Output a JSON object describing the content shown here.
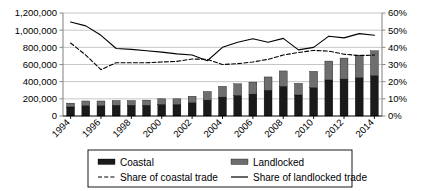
{
  "chart_data": {
    "type": "bar",
    "title": "",
    "subtitle": "",
    "xlabel": "",
    "ylabel": "",
    "y2label": "",
    "grid": true,
    "legend_position": "bottom",
    "x": [
      1994,
      1995,
      1996,
      1997,
      1998,
      1999,
      2000,
      2001,
      2002,
      2003,
      2004,
      2005,
      2006,
      2007,
      2008,
      2009,
      2010,
      2011,
      2012,
      2013,
      2014
    ],
    "categories": [
      "1994",
      "1995",
      "1996",
      "1997",
      "1998",
      "1999",
      "2000",
      "2001",
      "2002",
      "2003",
      "2004",
      "2005",
      "2006",
      "2007",
      "2008",
      "2009",
      "2010",
      "2011",
      "2012",
      "2013",
      "2014"
    ],
    "xtick_labels": [
      "1994",
      "1996",
      "1998",
      "2000",
      "2002",
      "2004",
      "2006",
      "2008",
      "2010",
      "2012",
      "2014"
    ],
    "ylim": [
      0,
      1200000
    ],
    "ytick_labels": [
      "0",
      "200,000",
      "400,000",
      "600,000",
      "800,000",
      "1,000,000",
      "1,200,000"
    ],
    "ytick_values": [
      0,
      200000,
      400000,
      600000,
      800000,
      1000000,
      1200000
    ],
    "y2lim": [
      0,
      0.6
    ],
    "y2tick_labels": [
      "0%",
      "10%",
      "20%",
      "30%",
      "40%",
      "50%",
      "60%"
    ],
    "y2tick_values": [
      0,
      0.1,
      0.2,
      0.3,
      0.4,
      0.5,
      0.6
    ],
    "bar_stacked": true,
    "series": [
      {
        "name": "Coastal",
        "kind": "bar",
        "stack": "total",
        "color": "#1a1a1a",
        "axis": "left",
        "values": [
          105000,
          120000,
          120000,
          125000,
          125000,
          125000,
          135000,
          135000,
          155000,
          185000,
          220000,
          240000,
          255000,
          300000,
          345000,
          245000,
          330000,
          420000,
          430000,
          445000,
          470000
        ]
      },
      {
        "name": "Landlocked",
        "kind": "bar",
        "stack": "total",
        "color": "#6e6e6e",
        "axis": "left",
        "values": [
          45000,
          55000,
          55000,
          55000,
          55000,
          60000,
          65000,
          65000,
          75000,
          100000,
          125000,
          135000,
          140000,
          155000,
          180000,
          135000,
          190000,
          220000,
          245000,
          265000,
          290000
        ]
      },
      {
        "name": "Share of coastal trade",
        "kind": "line",
        "style": "dashed",
        "color": "#000000",
        "axis": "right",
        "values": [
          0.425,
          0.355,
          0.27,
          0.31,
          0.31,
          0.31,
          0.315,
          0.318,
          0.332,
          0.33,
          0.3,
          0.305,
          0.315,
          0.33,
          0.355,
          0.37,
          0.382,
          0.378,
          0.36,
          0.352,
          0.355
        ]
      },
      {
        "name": "Share of landlocked trade",
        "kind": "line",
        "style": "solid",
        "color": "#000000",
        "axis": "right",
        "values": [
          0.548,
          0.525,
          0.47,
          0.393,
          0.388,
          0.38,
          0.372,
          0.362,
          0.355,
          0.322,
          0.4,
          0.43,
          0.45,
          0.43,
          0.452,
          0.385,
          0.4,
          0.465,
          0.455,
          0.48,
          0.47
        ]
      }
    ],
    "legend": [
      {
        "label": "Coastal",
        "marker": "bar",
        "color": "#1a1a1a"
      },
      {
        "label": "Landlocked",
        "marker": "bar",
        "color": "#6e6e6e"
      },
      {
        "label": "Share of coastal trade",
        "marker": "dashed-line",
        "color": "#000000"
      },
      {
        "label": "Share of landlocked trade",
        "marker": "solid-line",
        "color": "#000000"
      }
    ]
  },
  "style": {
    "background": "#ffffff",
    "gridline_color": "#b8b8b8",
    "axis_color": "#8a8a8a",
    "text_color": "#000000"
  }
}
